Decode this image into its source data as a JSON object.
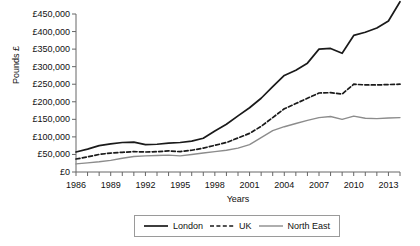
{
  "chart_data": {
    "type": "line",
    "title": "",
    "xlabel": "Years",
    "ylabel": "Pounds £",
    "xlim": [
      1986,
      2014
    ],
    "ylim": [
      0,
      450000
    ],
    "grid": false,
    "legend_position": "bottom",
    "x_tick_labels": [
      "1986",
      "1989",
      "1992",
      "1995",
      "1998",
      "2001",
      "2004",
      "2007",
      "2010",
      "2013"
    ],
    "x_tick_values": [
      1986,
      1989,
      1992,
      1995,
      1998,
      2001,
      2004,
      2007,
      2010,
      2013
    ],
    "y_tick_labels": [
      "£0",
      "£50,000",
      "£100,000",
      "£150,000",
      "£200,000",
      "£250,000",
      "£300,000",
      "£350,000",
      "£400,000",
      "£450,000"
    ],
    "y_tick_values": [
      0,
      50000,
      100000,
      150000,
      200000,
      250000,
      300000,
      350000,
      400000,
      450000
    ],
    "x": [
      1986,
      1987,
      1988,
      1989,
      1990,
      1991,
      1992,
      1993,
      1994,
      1995,
      1996,
      1997,
      1998,
      1999,
      2000,
      2001,
      2002,
      2003,
      2004,
      2005,
      2006,
      2007,
      2008,
      2009,
      2010,
      2011,
      2012,
      2013,
      2014
    ],
    "series": [
      {
        "name": "London",
        "color": "#1a1a1a",
        "style": "solid",
        "values": [
          57000,
          65000,
          75000,
          80000,
          84000,
          85000,
          78000,
          79000,
          82000,
          84000,
          88000,
          96000,
          117000,
          136000,
          160000,
          183000,
          210000,
          243000,
          275000,
          290000,
          310000,
          350000,
          352000,
          338000,
          389000,
          398000,
          410000,
          430000,
          485000
        ]
      },
      {
        "name": "UK",
        "color": "#1a1a1a",
        "style": "dashed",
        "values": [
          37000,
          43000,
          50000,
          54000,
          56000,
          58000,
          57000,
          58000,
          60000,
          58000,
          62000,
          68000,
          76000,
          84000,
          97000,
          110000,
          130000,
          155000,
          180000,
          195000,
          210000,
          225000,
          226000,
          222000,
          250000,
          248000,
          248000,
          249000,
          250000
        ]
      },
      {
        "name": "North East",
        "color": "#8c8c8c",
        "style": "solid",
        "values": [
          23000,
          26000,
          29000,
          33000,
          39000,
          44000,
          46000,
          47000,
          48000,
          46000,
          50000,
          54000,
          58000,
          62000,
          68000,
          78000,
          98000,
          118000,
          129000,
          138000,
          147000,
          155000,
          158000,
          150000,
          159000,
          153000,
          152000,
          154000,
          155000
        ]
      }
    ]
  },
  "axes": {
    "y_title": "Pounds £",
    "x_title": "Years"
  },
  "legend": {
    "entries": [
      {
        "label": "London",
        "color": "#1a1a1a",
        "style": "solid"
      },
      {
        "label": "UK",
        "color": "#1a1a1a",
        "style": "dashed"
      },
      {
        "label": "North East",
        "color": "#8c8c8c",
        "style": "solid"
      }
    ]
  }
}
